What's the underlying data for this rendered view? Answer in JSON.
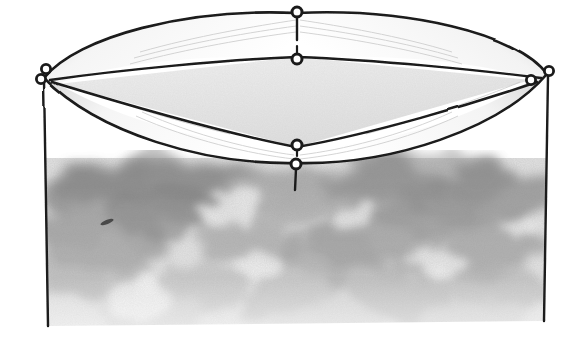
{
  "image": {
    "kind": "hand-drawn-sketch",
    "subject": "circular tent canopy with inner diamond panel and eyelets",
    "medium": "pencil and ink line drawing",
    "width_px": 578,
    "height_px": 358,
    "background_color": "#ffffff"
  },
  "palette": {
    "ink": "#1a1a1a",
    "ink_soft": "#2b2b2b",
    "paper": "#ffffff",
    "panel_fill": "#e9e9e9",
    "gusset_fill": "#fbfbfb",
    "gusset_shadow": "#d8d8d8",
    "wall_shade_dark": "#8e8e8e",
    "wall_shade_mid": "#b4b4b4",
    "wall_shade_light": "#dcdcdc",
    "smudge": "#3a3a3a"
  },
  "geometry": {
    "canopy_rim": {
      "left_corner": [
        44,
        78
      ],
      "right_corner": [
        547,
        74
      ],
      "top_vertex": [
        297,
        13
      ],
      "bottom_vertex": [
        297,
        163
      ]
    },
    "inner_diamond": {
      "left_corner": [
        58,
        84
      ],
      "right_corner": [
        531,
        80
      ],
      "top_vertex": [
        297,
        57
      ],
      "bottom_vertex": [
        297,
        147
      ]
    },
    "left_wall_line": {
      "x1": 44,
      "y1": 80,
      "x2": 48,
      "y2": 326
    },
    "right_wall_line": {
      "x1": 548,
      "y1": 76,
      "x2": 544,
      "y2": 321
    }
  },
  "eyelets": [
    {
      "name": "eyelet-top-outer",
      "cx": 297,
      "cy": 13,
      "r": 5,
      "tail_length": 24
    },
    {
      "name": "eyelet-top-inner",
      "cx": 297,
      "cy": 58,
      "r": 5,
      "tail_length": 0
    },
    {
      "name": "eyelet-left-upper",
      "cx": 45,
      "cy": 70,
      "r": 4.5,
      "tail_length": 0
    },
    {
      "name": "eyelet-left-lower",
      "cx": 42,
      "cy": 80,
      "r": 4.5,
      "tail_length": 0
    },
    {
      "name": "eyelet-right-upper",
      "cx": 548,
      "cy": 72,
      "r": 4.5,
      "tail_length": 0
    },
    {
      "name": "eyelet-right-lower",
      "cx": 531,
      "cy": 80,
      "r": 4.5,
      "tail_length": 0
    },
    {
      "name": "eyelet-bottom-inner",
      "cx": 297,
      "cy": 147,
      "r": 5,
      "tail_length": 0
    },
    {
      "name": "eyelet-bottom-outer",
      "cx": 296,
      "cy": 164,
      "r": 5,
      "tail_length": 22
    }
  ],
  "shading": {
    "description": "mottled cloud-like pencil shading on the cylindrical wall, darkest near the upper-left and fading to white at the bottom",
    "top_y": 160,
    "bottom_y": 352,
    "fade_start_y": 270,
    "blob_count": 26,
    "smudge_mark": {
      "cx": 107,
      "cy": 222,
      "rx": 7,
      "ry": 2.2,
      "angle": -22
    }
  },
  "labels": {
    "figure_title": "",
    "annotations": []
  }
}
